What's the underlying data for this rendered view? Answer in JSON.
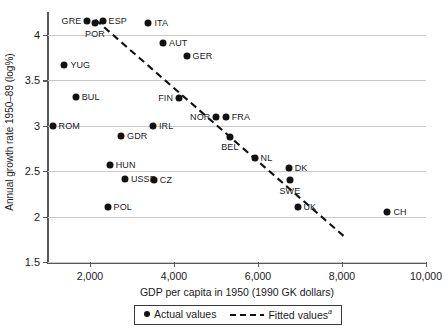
{
  "chart_data": {
    "type": "scatter",
    "title": "",
    "xlabel": "GDP per capita in 1950 (1990 GK dollars)",
    "ylabel": "Annual growth rate 1950–89 (log%)",
    "xlim": [
      1000,
      10000
    ],
    "ylim": [
      1.5,
      4.25
    ],
    "xticks": [
      2000,
      4000,
      6000,
      8000,
      10000
    ],
    "xtick_labels": [
      "2,000",
      "4,000",
      "6,000",
      "8,000",
      "10,000"
    ],
    "yticks": [
      1.5,
      2,
      2.5,
      3,
      3.5,
      4
    ],
    "ytick_labels": [
      "1.5",
      "2",
      "2.5",
      "3",
      "3.5",
      "4"
    ],
    "grid": "horizontal",
    "legend_position": "below-axis",
    "series": [
      {
        "name": "Actual values",
        "marker": "filled-circle",
        "color": "#111111",
        "points": [
          {
            "label": "GRE",
            "x": 1937,
            "y": 4.155,
            "label_pos": "left"
          },
          {
            "label": "POR",
            "x": 2120,
            "y": 4.125,
            "label_pos": "below"
          },
          {
            "label": "ESP",
            "x": 2300,
            "y": 4.155,
            "label_pos": "right"
          },
          {
            "label": "ITA",
            "x": 3390,
            "y": 4.13,
            "label_pos": "right"
          },
          {
            "label": "AUT",
            "x": 3740,
            "y": 3.91,
            "label_pos": "right"
          },
          {
            "label": "GER",
            "x": 4300,
            "y": 3.77,
            "label_pos": "right"
          },
          {
            "label": "YUG",
            "x": 1390,
            "y": 3.67,
            "label_pos": "right"
          },
          {
            "label": "BUL",
            "x": 1660,
            "y": 3.32,
            "label_pos": "right"
          },
          {
            "label": "FIN",
            "x": 4120,
            "y": 3.3,
            "label_pos": "left"
          },
          {
            "label": "ROM",
            "x": 1110,
            "y": 3.0,
            "label_pos": "right"
          },
          {
            "label": "IRL",
            "x": 3500,
            "y": 3.0,
            "label_pos": "right"
          },
          {
            "label": "NOR",
            "x": 5010,
            "y": 3.1,
            "label_pos": "left"
          },
          {
            "label": "FRA",
            "x": 5230,
            "y": 3.1,
            "label_pos": "right"
          },
          {
            "label": "GDR",
            "x": 2740,
            "y": 2.89,
            "label_pos": "right"
          },
          {
            "label": "BEL",
            "x": 5330,
            "y": 2.88,
            "label_pos": "below"
          },
          {
            "label": "NL",
            "x": 5920,
            "y": 2.65,
            "label_pos": "right"
          },
          {
            "label": "HUN",
            "x": 2470,
            "y": 2.57,
            "label_pos": "right"
          },
          {
            "label": "USSR",
            "x": 2830,
            "y": 2.41,
            "label_pos": "right"
          },
          {
            "label": "CZ",
            "x": 3520,
            "y": 2.4,
            "label_pos": "right"
          },
          {
            "label": "DK",
            "x": 6730,
            "y": 2.54,
            "label_pos": "right"
          },
          {
            "label": "SWE",
            "x": 6760,
            "y": 2.4,
            "label_pos": "below"
          },
          {
            "label": "POL",
            "x": 2420,
            "y": 2.11,
            "label_pos": "right"
          },
          {
            "label": "UK",
            "x": 6940,
            "y": 2.11,
            "label_pos": "right"
          },
          {
            "label": "CH",
            "x": 9080,
            "y": 2.05,
            "label_pos": "right"
          }
        ]
      },
      {
        "name": "Fitted values",
        "style": "dashed",
        "color": "#111111",
        "endpoints": [
          {
            "x": 2130,
            "y": 4.165
          },
          {
            "x": 8080,
            "y": 1.77
          }
        ]
      }
    ]
  },
  "legend": {
    "actual_label": "Actual values",
    "fitted_label": "Fitted values",
    "fitted_superscript": "a"
  }
}
